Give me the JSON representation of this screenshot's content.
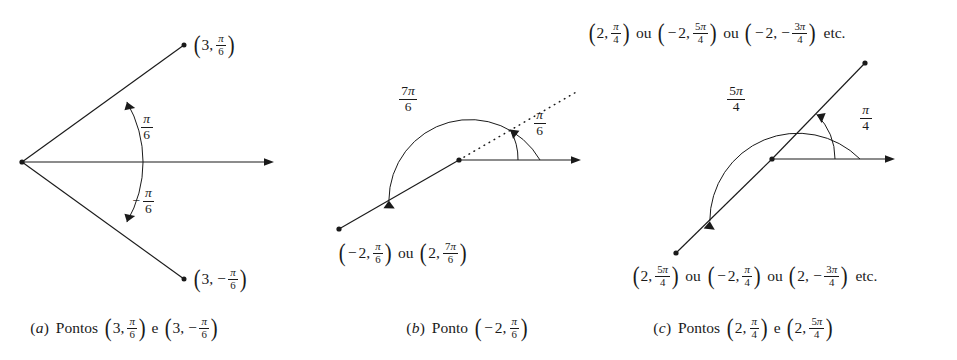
{
  "figure": {
    "kind": "polar-coordinates-illustration",
    "background_color": "#ffffff",
    "ink_color": "#1a1a1a",
    "panels": [
      {
        "id": "a",
        "caption_tag": "(a)",
        "caption_text": "Pontos",
        "caption_point_1": "(3, π/6)",
        "caption_conj": "e",
        "caption_point_2": "(3, −π/6)",
        "point_label_upper": "(3, π/6)",
        "point_label_lower": "(3, −π/6)",
        "arc_label_upper": "π/6",
        "arc_label_lower": "−π/6",
        "radius": "3",
        "angle_upper": "π/6",
        "angle_lower": "−π/6"
      },
      {
        "id": "b",
        "caption_tag": "(b)",
        "caption_text": "Ponto",
        "caption_point_1": "(−2, π/6)",
        "point_label_bottom_1": "(−2, π/6)",
        "point_label_conj": "ou",
        "point_label_bottom_2": "(2, 7π/6)",
        "arc_label_outer": "7π/6",
        "arc_label_inner": "π/6",
        "radius": "2",
        "angle_dotted": "π/6",
        "angle_solid": "7π/6"
      },
      {
        "id": "c",
        "caption_tag": "(c)",
        "caption_text": "Pontos",
        "caption_point_1": "(2, π/4)",
        "caption_conj": "e",
        "caption_point_2": "(2, 5π/4)",
        "top_label_1": "(2, π/4)",
        "top_label_conj_1": "ou",
        "top_label_2": "(−2, 5π/4)",
        "top_label_conj_2": "ou",
        "top_label_3": "(−2, −3π/4)",
        "top_label_etc": "etc.",
        "bottom_label_1": "(2, 5π/4)",
        "bottom_label_conj_1": "ou",
        "bottom_label_2": "(−2, π/4)",
        "bottom_label_conj_2": "ou",
        "bottom_label_3": "(2, −3π/4)",
        "bottom_label_etc": "etc.",
        "arc_label_outer": "5π/4",
        "arc_label_inner": "π/4",
        "radius": "2",
        "angle_upper": "π/4",
        "angle_lower": "5π/4"
      }
    ],
    "words": {
      "ou": "ou",
      "e": "e",
      "etc": "etc.",
      "pontos": "Pontos",
      "ponto": "Ponto"
    },
    "glyphs": {
      "pi": "π",
      "minus": "−",
      "comma": ",",
      "lparen": "(",
      "rparen": ")"
    }
  }
}
